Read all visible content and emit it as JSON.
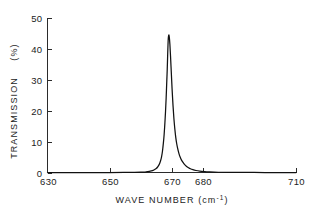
{
  "chart_data": {
    "type": "line",
    "title": "",
    "subtitle": "",
    "xlabel": "WAVE NUMBER (cm",
    "xlabel_exponent": "-1",
    "xlabel_tail": ")",
    "xlabel_full": "WAVE NUMBER (cm-1)",
    "ylabel": "TRANSMISSION",
    "ylabel_units": "(%)",
    "ylabel_full": "TRANSMISSION (%)",
    "xlim": [
      630,
      710
    ],
    "ylim": [
      0,
      50
    ],
    "grid": false,
    "legend": null,
    "xticks": [
      630,
      650,
      670,
      680,
      710
    ],
    "xtick_labels": [
      "630",
      "650",
      "670",
      "680",
      "710"
    ],
    "yticks": [
      0,
      10,
      20,
      30,
      40,
      50
    ],
    "ytick_labels": [
      "0",
      "10",
      "20",
      "30",
      "40",
      "50"
    ],
    "series": [
      {
        "name": "transmission",
        "color": "#111111",
        "peak_center": 668.8,
        "peak_height": 44.5,
        "half_width": 1.25,
        "x": [
          630.0,
          640.0,
          650.0,
          655.0,
          658.0,
          660.0,
          661.0,
          662.0,
          662.8,
          663.4,
          664.0,
          664.5,
          665.0,
          665.4,
          665.8,
          666.1,
          666.4,
          666.7,
          667.0,
          667.3,
          667.55,
          667.8,
          668.0,
          668.2,
          668.4,
          668.55,
          668.7,
          668.8,
          668.9,
          669.05,
          669.2,
          669.4,
          669.6,
          669.85,
          670.1,
          670.4,
          670.7,
          671.0,
          671.3,
          671.6,
          671.9,
          672.3,
          672.7,
          673.1,
          673.6,
          674.1,
          674.7,
          675.3,
          676.0,
          676.8,
          677.8,
          679.0,
          680.5,
          682.0,
          685.0,
          690.0,
          700.0,
          710.0
        ],
        "y": [
          0.0,
          0.0,
          0.0,
          0.02,
          0.05,
          0.1,
          0.15,
          0.25,
          0.35,
          0.5,
          0.7,
          0.95,
          1.3,
          1.7,
          2.3,
          2.9,
          3.8,
          5.0,
          6.8,
          9.5,
          12.3,
          16.2,
          19.8,
          24.2,
          29.5,
          33.5,
          38.5,
          41.5,
          43.6,
          44.5,
          43.9,
          41.5,
          37.8,
          32.5,
          27.2,
          21.8,
          17.4,
          14.0,
          11.3,
          9.3,
          7.8,
          6.2,
          5.0,
          4.1,
          3.3,
          2.6,
          2.0,
          1.6,
          1.2,
          0.9,
          0.65,
          0.45,
          0.3,
          0.2,
          0.08,
          0.02,
          0.0,
          0.0
        ]
      }
    ]
  },
  "axes": {
    "x_title_text": "WAVE NUMBER (cm",
    "x_title_sup": "-1",
    "x_title_close": ")",
    "y_title_text": "TRANSMISSION",
    "y_units_text": "(%)"
  }
}
